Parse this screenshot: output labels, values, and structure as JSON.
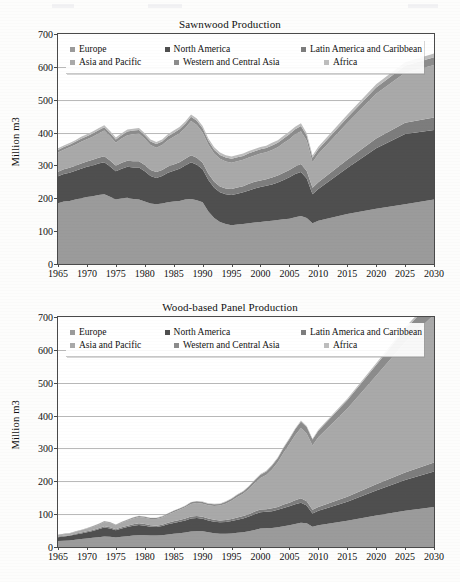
{
  "document": {
    "type": "scanned-figure-page",
    "figure_count": 2
  },
  "legend": {
    "items": [
      {
        "label": "Europe",
        "color": "#9b9b9b"
      },
      {
        "label": "North America",
        "color": "#4f4f4f"
      },
      {
        "label": "Latin America and Caribbean",
        "color": "#7d7d7d"
      },
      {
        "label": "Asia and Pacific",
        "color": "#a9a9a9"
      },
      {
        "label": "Western and Central Asia",
        "color": "#8c8c8c"
      },
      {
        "label": "Africa",
        "color": "#bdbdbd"
      }
    ]
  },
  "axes": {
    "ylabel": "Million m3",
    "yticks": [
      "0",
      "100",
      "200",
      "300",
      "400",
      "500",
      "600",
      "700"
    ],
    "xticks": [
      "1965",
      "1970",
      "1975",
      "1980",
      "1985",
      "1990",
      "1995",
      "2000",
      "2005",
      "2010",
      "2015",
      "2020",
      "2025",
      "2030"
    ]
  },
  "chart_data": [
    {
      "type": "area",
      "stacked": true,
      "title": "Sawnwood Production",
      "xlabel": "",
      "ylabel": "Million m3",
      "ylim": [
        0,
        700
      ],
      "xlim": [
        1965,
        2030
      ],
      "grid": true,
      "legend_position": "top-inside",
      "x": [
        1965,
        1966,
        1967,
        1968,
        1969,
        1970,
        1971,
        1972,
        1973,
        1974,
        1975,
        1976,
        1977,
        1978,
        1979,
        1980,
        1981,
        1982,
        1983,
        1984,
        1985,
        1986,
        1987,
        1988,
        1989,
        1990,
        1991,
        1992,
        1993,
        1994,
        1995,
        1996,
        1997,
        1998,
        1999,
        2000,
        2001,
        2002,
        2003,
        2004,
        2005,
        2006,
        2007,
        2008,
        2009,
        2010,
        2015,
        2020,
        2025,
        2030
      ],
      "series": [
        {
          "name": "Europe",
          "values": [
            185,
            190,
            192,
            196,
            200,
            204,
            206,
            210,
            212,
            205,
            196,
            200,
            202,
            198,
            196,
            190,
            184,
            182,
            184,
            188,
            190,
            192,
            196,
            198,
            194,
            188,
            160,
            140,
            128,
            122,
            118,
            120,
            122,
            124,
            126,
            128,
            130,
            132,
            134,
            136,
            138,
            142,
            146,
            140,
            124,
            132,
            152,
            168,
            182,
            196
          ]
        },
        {
          "name": "North America",
          "values": [
            82,
            84,
            86,
            88,
            90,
            92,
            94,
            96,
            98,
            92,
            86,
            90,
            94,
            96,
            98,
            92,
            84,
            80,
            84,
            90,
            94,
            98,
            104,
            112,
            108,
            100,
            96,
            92,
            90,
            90,
            92,
            94,
            96,
            100,
            104,
            106,
            108,
            110,
            114,
            120,
            126,
            132,
            134,
            120,
            88,
            96,
            140,
            184,
            214,
            212
          ]
        },
        {
          "name": "Latin America and Caribbean",
          "values": [
            14,
            14,
            15,
            15,
            16,
            16,
            17,
            17,
            18,
            18,
            17,
            18,
            18,
            19,
            19,
            19,
            18,
            18,
            18,
            19,
            19,
            20,
            20,
            21,
            21,
            20,
            19,
            18,
            18,
            18,
            18,
            19,
            19,
            20,
            20,
            20,
            20,
            21,
            21,
            22,
            22,
            23,
            24,
            23,
            20,
            21,
            25,
            30,
            34,
            38
          ]
        },
        {
          "name": "Asia and Pacific",
          "values": [
            58,
            60,
            62,
            64,
            66,
            68,
            70,
            74,
            78,
            74,
            70,
            74,
            78,
            82,
            84,
            80,
            76,
            74,
            76,
            80,
            84,
            88,
            94,
            104,
            100,
            92,
            88,
            86,
            84,
            82,
            80,
            80,
            80,
            80,
            80,
            82,
            82,
            84,
            86,
            90,
            94,
            98,
            100,
            92,
            78,
            86,
            112,
            136,
            152,
            160
          ]
        },
        {
          "name": "Western and Central Asia",
          "values": [
            8,
            8,
            8,
            9,
            9,
            9,
            10,
            10,
            10,
            10,
            10,
            10,
            11,
            11,
            11,
            11,
            11,
            11,
            11,
            12,
            12,
            12,
            13,
            13,
            13,
            13,
            12,
            12,
            12,
            12,
            12,
            12,
            12,
            13,
            13,
            13,
            13,
            14,
            14,
            14,
            15,
            15,
            16,
            15,
            13,
            14,
            16,
            19,
            21,
            23
          ]
        },
        {
          "name": "Africa",
          "values": [
            5,
            5,
            5,
            5,
            6,
            6,
            6,
            6,
            6,
            6,
            6,
            6,
            6,
            6,
            6,
            6,
            6,
            6,
            6,
            6,
            7,
            7,
            7,
            7,
            7,
            7,
            7,
            7,
            7,
            7,
            7,
            7,
            7,
            7,
            7,
            7,
            7,
            8,
            8,
            8,
            8,
            8,
            8,
            8,
            7,
            8,
            9,
            10,
            11,
            12
          ]
        }
      ],
      "annotations": [
        "Total peaks near 460 around 1988",
        "Sharp decline after 1990 to about 380",
        "Drop to about 350 in 2009",
        "Rises to about 590 by 2030"
      ]
    },
    {
      "type": "area",
      "stacked": true,
      "title": "Wood-based Panel Production",
      "xlabel": "",
      "ylabel": "Million m3",
      "ylim": [
        0,
        700
      ],
      "xlim": [
        1965,
        2030
      ],
      "grid": true,
      "legend_position": "top-inside",
      "x": [
        1965,
        1966,
        1967,
        1968,
        1969,
        1970,
        1971,
        1972,
        1973,
        1974,
        1975,
        1976,
        1977,
        1978,
        1979,
        1980,
        1981,
        1982,
        1983,
        1984,
        1985,
        1986,
        1987,
        1988,
        1989,
        1990,
        1991,
        1992,
        1993,
        1994,
        1995,
        1996,
        1997,
        1998,
        1999,
        2000,
        2001,
        2002,
        2003,
        2004,
        2005,
        2006,
        2007,
        2008,
        2009,
        2010,
        2015,
        2020,
        2025,
        2030
      ],
      "series": [
        {
          "name": "Europe",
          "values": [
            18,
            19,
            20,
            22,
            24,
            26,
            28,
            30,
            32,
            31,
            29,
            31,
            33,
            35,
            36,
            36,
            35,
            35,
            36,
            38,
            40,
            42,
            44,
            47,
            48,
            48,
            45,
            42,
            40,
            40,
            41,
            43,
            45,
            48,
            52,
            56,
            57,
            58,
            60,
            63,
            66,
            70,
            74,
            72,
            62,
            66,
            80,
            96,
            110,
            122
          ]
        },
        {
          "name": "North America",
          "values": [
            12,
            13,
            14,
            16,
            17,
            19,
            21,
            24,
            27,
            25,
            22,
            25,
            28,
            30,
            31,
            29,
            27,
            26,
            28,
            31,
            33,
            35,
            37,
            40,
            40,
            38,
            36,
            35,
            35,
            36,
            38,
            40,
            42,
            45,
            48,
            50,
            50,
            51,
            53,
            56,
            58,
            60,
            61,
            54,
            40,
            44,
            58,
            76,
            94,
            108
          ]
        },
        {
          "name": "Latin America and Caribbean",
          "values": [
            2,
            2,
            2,
            2,
            3,
            3,
            3,
            3,
            4,
            4,
            3,
            4,
            4,
            4,
            5,
            5,
            4,
            4,
            4,
            5,
            5,
            5,
            6,
            6,
            6,
            6,
            6,
            6,
            6,
            6,
            6,
            7,
            7,
            7,
            8,
            8,
            8,
            9,
            9,
            10,
            11,
            12,
            13,
            13,
            11,
            12,
            15,
            19,
            23,
            27
          ]
        },
        {
          "name": "Asia and Pacific",
          "values": [
            4,
            5,
            5,
            6,
            7,
            8,
            9,
            11,
            13,
            13,
            12,
            14,
            16,
            18,
            19,
            19,
            19,
            20,
            22,
            25,
            28,
            31,
            34,
            38,
            40,
            40,
            40,
            42,
            45,
            50,
            56,
            62,
            68,
            76,
            86,
            96,
            104,
            118,
            136,
            158,
            178,
            198,
            214,
            206,
            196,
            212,
            268,
            330,
            396,
            450
          ]
        },
        {
          "name": "Western and Central Asia",
          "values": [
            1,
            1,
            1,
            1,
            1,
            1,
            2,
            2,
            2,
            2,
            2,
            2,
            2,
            3,
            3,
            3,
            3,
            3,
            3,
            3,
            4,
            4,
            4,
            5,
            5,
            5,
            5,
            5,
            5,
            6,
            6,
            7,
            7,
            8,
            9,
            10,
            11,
            12,
            13,
            15,
            16,
            18,
            20,
            20,
            18,
            20,
            26,
            33,
            40,
            47
          ]
        },
        {
          "name": "Africa",
          "values": [
            0.5,
            0.5,
            0.5,
            0.6,
            0.6,
            0.7,
            0.7,
            0.8,
            0.8,
            0.8,
            0.8,
            0.8,
            0.9,
            0.9,
            1,
            1,
            1,
            1,
            1,
            1,
            1.1,
            1.2,
            1.2,
            1.3,
            1.3,
            1.3,
            1.3,
            1.3,
            1.4,
            1.4,
            1.5,
            1.5,
            1.6,
            1.7,
            1.8,
            1.9,
            2,
            2.1,
            2.2,
            2.4,
            2.6,
            2.8,
            3,
            3,
            2.8,
            3,
            4,
            5,
            6,
            7
          ]
        }
      ],
      "annotations": [
        "Starts near 35 in 1965",
        "Local peak about 270 in 2007",
        "Dip around 2009",
        "Rises to about 510 by 2030"
      ]
    }
  ]
}
